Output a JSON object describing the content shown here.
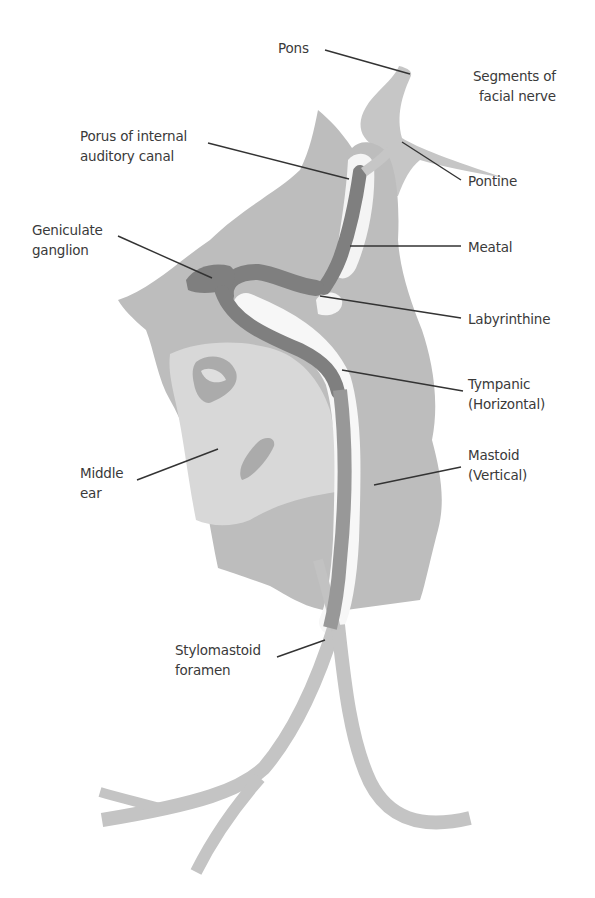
{
  "diagram": {
    "title": "Segments of facial nerve",
    "title_lines": [
      "Segments of",
      "facial nerve"
    ],
    "colors": {
      "background": "#ffffff",
      "bone_light": "#cfcfcf",
      "bone_mid": "#b2b2b2",
      "nerve_dark": "#7d7d7d",
      "nerve_mid": "#9a9a9a",
      "canal_white": "#f7f7f7",
      "leader_line": "#333333",
      "label_text": "#3a3a3a"
    },
    "labels": {
      "pons": {
        "lines": [
          "Pons"
        ]
      },
      "porus": {
        "lines": [
          "Porus of internal",
          "auditory canal"
        ]
      },
      "pontine": {
        "lines": [
          "Pontine"
        ]
      },
      "geniculate": {
        "lines": [
          "Geniculate",
          "ganglion"
        ]
      },
      "meatal": {
        "lines": [
          "Meatal"
        ]
      },
      "labyrinthine": {
        "lines": [
          "Labyrinthine"
        ]
      },
      "tympanic": {
        "lines": [
          "Tympanic",
          "(Horizontal)"
        ]
      },
      "middle_ear": {
        "lines": [
          "Middle",
          "ear"
        ]
      },
      "mastoid": {
        "lines": [
          "Mastoid",
          "(Vertical)"
        ]
      },
      "stylomastoid": {
        "lines": [
          "Stylomastoid",
          "foramen"
        ]
      }
    }
  }
}
